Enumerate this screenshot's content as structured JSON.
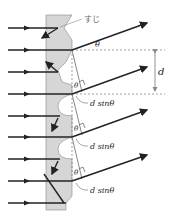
{
  "diagram": {
    "type": "reflection diffraction grating",
    "labels": {
      "groove": "すじ",
      "theta": "θ",
      "spacing": "d",
      "path_difference": "d sinθ"
    },
    "incident_ray_ys": [
      28,
      50,
      72,
      94,
      116,
      137,
      159,
      181,
      203
    ],
    "reflected_rays": [
      {
        "from": [
          72,
          50
        ],
        "to": [
          147,
          23
        ]
      },
      {
        "from": [
          72,
          94
        ],
        "to": [
          147,
          67
        ]
      },
      {
        "from": [
          72,
          137
        ],
        "to": [
          147,
          110
        ]
      },
      {
        "from": [
          72,
          181
        ],
        "to": [
          147,
          155
        ]
      }
    ],
    "colors": {
      "grating": "#d6d6d6",
      "ray": "#222222",
      "dash": "#777777",
      "arrow_d": "#888888"
    }
  }
}
